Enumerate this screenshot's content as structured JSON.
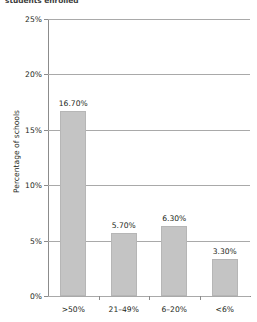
{
  "caption": {
    "partial_top_text": "students enrolled"
  },
  "chart_data": {
    "type": "bar",
    "title": "",
    "subtitle": "",
    "xlabel": "",
    "ylabel": "Percentage of schools",
    "categories": [
      ">50%",
      "21–49%",
      "6–20%",
      "<6%"
    ],
    "values": [
      16.7,
      5.7,
      6.3,
      3.3
    ],
    "value_labels": [
      "16.70%",
      "5.70%",
      "6.30%",
      "3.30%"
    ],
    "ylim": [
      0,
      25
    ],
    "ytick_values": [
      0,
      5,
      10,
      15,
      20,
      25
    ],
    "ytick_labels": [
      "0%",
      "5%",
      "10%",
      "15%",
      "20%",
      "25%"
    ],
    "grid": true,
    "legend": null,
    "bar_color": "#c4c4c4",
    "bar_border_color": "#b6b6b6",
    "axis_color": "#8c8c8c",
    "gridline_color": "#a9a9a9",
    "text_color": "#231f20"
  }
}
